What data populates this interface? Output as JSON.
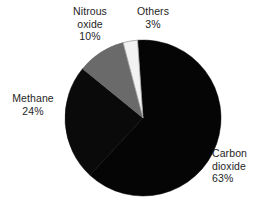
{
  "chart_data": {
    "type": "pie",
    "title": "",
    "subtitle": "",
    "xlabel": "",
    "ylabel": "",
    "legend_position": "none",
    "grid": false,
    "unit": "%",
    "start_angle_deg": -94,
    "direction": "clockwise",
    "categories": [
      "Carbon dioxide",
      "Methane",
      "Nitrous oxide",
      "Others"
    ],
    "values": [
      63,
      24,
      10,
      3
    ],
    "slices": [
      {
        "name": "Carbon dioxide",
        "label_line1": "Carbon",
        "label_line2": "dioxide",
        "value": 63,
        "value_label": "63%",
        "color": "#050505"
      },
      {
        "name": "Methane",
        "label_line1": "Methane",
        "label_line2": "",
        "value": 24,
        "value_label": "24%",
        "color": "#0a0a0a"
      },
      {
        "name": "Nitrous oxide",
        "label_line1": "Nitrous",
        "label_line2": "oxide",
        "value": 10,
        "value_label": "10%",
        "color": "#6a6a6a"
      },
      {
        "name": "Others",
        "label_line1": "Others",
        "label_line2": "",
        "value": 3,
        "value_label": "3%",
        "color": "#f2f2f2"
      }
    ]
  },
  "colors": {
    "background": "#ffffff",
    "text": "#1e1e1e",
    "carbon_dioxide": "#050505",
    "methane": "#0a0a0a",
    "nitrous_oxide": "#6a6a6a",
    "others": "#f2f2f2",
    "slice_outline": "#9a9a9a"
  },
  "geometry": {
    "center_x": 143,
    "center_y": 118,
    "radius": 78
  }
}
